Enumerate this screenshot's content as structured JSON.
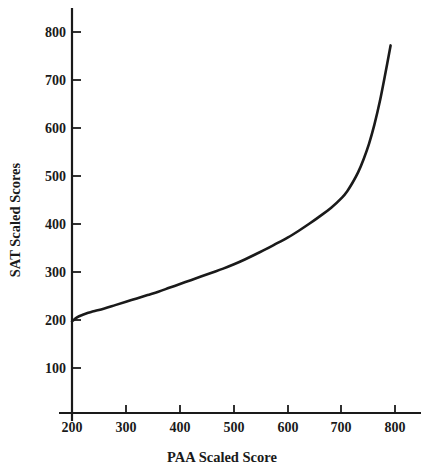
{
  "chart_data": {
    "type": "line",
    "title": "",
    "xlabel": "PAA Scaled Score",
    "ylabel": "SAT Scaled Scores",
    "xlim": [
      180,
      820
    ],
    "ylim": [
      0,
      845
    ],
    "xticks": [
      200,
      300,
      400,
      500,
      600,
      700,
      800
    ],
    "yticks": [
      100,
      200,
      300,
      400,
      500,
      600,
      700,
      800
    ],
    "xtick_labels": [
      "200",
      "300",
      "400",
      "500",
      "600",
      "700",
      "800"
    ],
    "ytick_labels": [
      "100",
      "200",
      "300",
      "400",
      "500",
      "600",
      "700",
      "800"
    ],
    "grid": false,
    "legend": null,
    "series": [
      {
        "name": "PAA to SAT concordance",
        "x": [
          200,
          210,
          220,
          230,
          240,
          260,
          280,
          300,
          320,
          340,
          360,
          380,
          400,
          420,
          440,
          460,
          480,
          500,
          520,
          540,
          560,
          580,
          600,
          620,
          640,
          660,
          680,
          700,
          710,
          720,
          730,
          740,
          750,
          760,
          770,
          780,
          790
        ],
        "y": [
          197,
          206,
          211,
          215,
          218,
          224,
          231,
          238,
          245,
          252,
          259,
          267,
          275,
          283,
          291,
          299,
          307,
          316,
          326,
          337,
          348,
          360,
          372,
          386,
          401,
          417,
          434,
          455,
          469,
          487,
          508,
          535,
          567,
          607,
          655,
          712,
          772
        ]
      }
    ],
    "line_color": "#1a1a1a",
    "background_color": "#ffffff"
  },
  "axis": {
    "x_title": "PAA Scaled Score",
    "y_title": "SAT Scaled Scores"
  }
}
